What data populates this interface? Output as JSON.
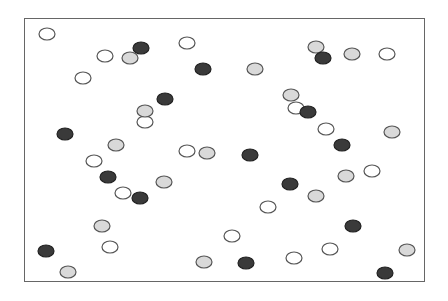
{
  "diagram": {
    "type": "scatter-circles",
    "frame": {
      "x": 24,
      "y": 18,
      "width": 401,
      "height": 264
    },
    "radius": 7,
    "colors": {
      "white": "#ffffff",
      "gray": "#d9d9d9",
      "dark": "#3a3a3a",
      "stroke": "#555555"
    },
    "points": [
      {
        "x": 47,
        "y": 34,
        "kind": "white"
      },
      {
        "x": 105,
        "y": 56,
        "kind": "white"
      },
      {
        "x": 187,
        "y": 43,
        "kind": "white"
      },
      {
        "x": 83,
        "y": 78,
        "kind": "white"
      },
      {
        "x": 145,
        "y": 122,
        "kind": "white"
      },
      {
        "x": 94,
        "y": 161,
        "kind": "white"
      },
      {
        "x": 123,
        "y": 193,
        "kind": "white"
      },
      {
        "x": 187,
        "y": 151,
        "kind": "white"
      },
      {
        "x": 268,
        "y": 207,
        "kind": "white"
      },
      {
        "x": 232,
        "y": 236,
        "kind": "white"
      },
      {
        "x": 110,
        "y": 247,
        "kind": "white"
      },
      {
        "x": 294,
        "y": 258,
        "kind": "white"
      },
      {
        "x": 330,
        "y": 249,
        "kind": "white"
      },
      {
        "x": 387,
        "y": 54,
        "kind": "white"
      },
      {
        "x": 326,
        "y": 129,
        "kind": "white"
      },
      {
        "x": 372,
        "y": 171,
        "kind": "white"
      },
      {
        "x": 296,
        "y": 108,
        "kind": "white"
      },
      {
        "x": 130,
        "y": 58,
        "kind": "gray"
      },
      {
        "x": 145,
        "y": 111,
        "kind": "gray"
      },
      {
        "x": 116,
        "y": 145,
        "kind": "gray"
      },
      {
        "x": 164,
        "y": 182,
        "kind": "gray"
      },
      {
        "x": 207,
        "y": 153,
        "kind": "gray"
      },
      {
        "x": 255,
        "y": 69,
        "kind": "gray"
      },
      {
        "x": 316,
        "y": 47,
        "kind": "gray"
      },
      {
        "x": 352,
        "y": 54,
        "kind": "gray"
      },
      {
        "x": 291,
        "y": 95,
        "kind": "gray"
      },
      {
        "x": 392,
        "y": 132,
        "kind": "gray"
      },
      {
        "x": 346,
        "y": 176,
        "kind": "gray"
      },
      {
        "x": 316,
        "y": 196,
        "kind": "gray"
      },
      {
        "x": 102,
        "y": 226,
        "kind": "gray"
      },
      {
        "x": 68,
        "y": 272,
        "kind": "gray"
      },
      {
        "x": 204,
        "y": 262,
        "kind": "gray"
      },
      {
        "x": 407,
        "y": 250,
        "kind": "gray"
      },
      {
        "x": 141,
        "y": 48,
        "kind": "dark"
      },
      {
        "x": 203,
        "y": 69,
        "kind": "dark"
      },
      {
        "x": 165,
        "y": 99,
        "kind": "dark"
      },
      {
        "x": 65,
        "y": 134,
        "kind": "dark"
      },
      {
        "x": 108,
        "y": 177,
        "kind": "dark"
      },
      {
        "x": 140,
        "y": 198,
        "kind": "dark"
      },
      {
        "x": 250,
        "y": 155,
        "kind": "dark"
      },
      {
        "x": 323,
        "y": 58,
        "kind": "dark"
      },
      {
        "x": 308,
        "y": 112,
        "kind": "dark"
      },
      {
        "x": 342,
        "y": 145,
        "kind": "dark"
      },
      {
        "x": 290,
        "y": 184,
        "kind": "dark"
      },
      {
        "x": 353,
        "y": 226,
        "kind": "dark"
      },
      {
        "x": 46,
        "y": 251,
        "kind": "dark"
      },
      {
        "x": 246,
        "y": 263,
        "kind": "dark"
      },
      {
        "x": 385,
        "y": 273,
        "kind": "dark"
      }
    ]
  }
}
